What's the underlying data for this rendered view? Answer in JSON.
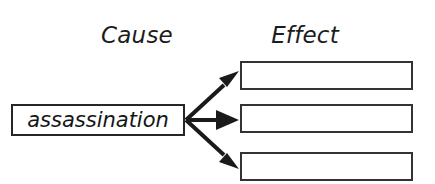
{
  "diagram": {
    "type": "cause-and-effect-graphic-organizer",
    "background_color": "#ffffff",
    "line_color": "#262626",
    "headings": {
      "cause": "Cause",
      "effect": "Effect"
    },
    "cause": {
      "label": "assassination",
      "box": {
        "x": 11,
        "y": 104,
        "width": 174,
        "height": 32
      }
    },
    "effects": [
      {
        "label": "",
        "box": {
          "x": 240,
          "y": 61,
          "width": 173,
          "height": 29
        }
      },
      {
        "label": "",
        "box": {
          "x": 240,
          "y": 104,
          "width": 173,
          "height": 29
        }
      },
      {
        "label": "",
        "box": {
          "x": 240,
          "y": 152,
          "width": 173,
          "height": 29
        }
      }
    ],
    "arrows": [
      {
        "name": "arrow-to-effect-1",
        "from": [
          186,
          120
        ],
        "to": [
          238,
          72
        ]
      },
      {
        "name": "arrow-to-effect-2",
        "from": [
          186,
          120
        ],
        "to": [
          238,
          120
        ]
      },
      {
        "name": "arrow-to-effect-3",
        "from": [
          186,
          120
        ],
        "to": [
          238,
          168
        ]
      }
    ]
  }
}
